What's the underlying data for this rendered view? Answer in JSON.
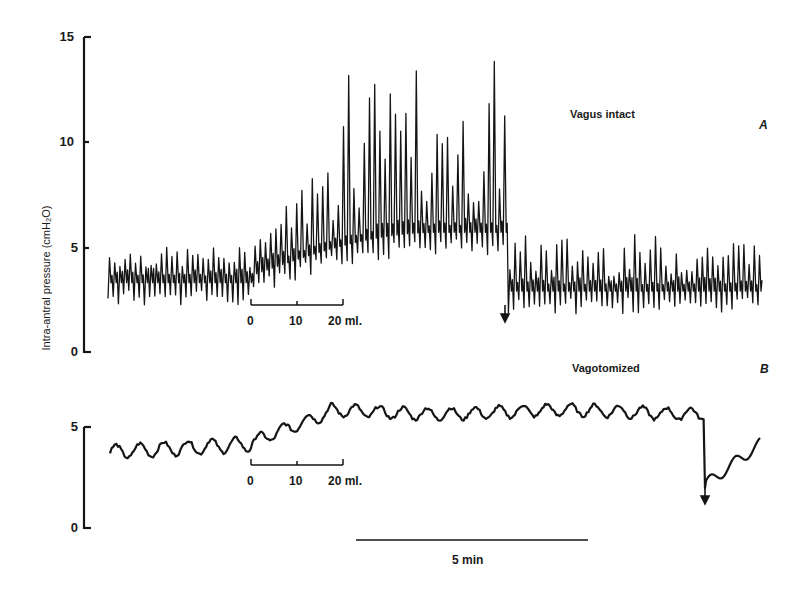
{
  "chart_data": [
    {
      "panel": "A",
      "type": "line",
      "title": "Vagus intact",
      "panel_letter": "A",
      "ylabel": "Intra-antral pressure (cmH₂O)",
      "yticks": [
        0,
        5,
        10,
        15
      ],
      "ylim": [
        0,
        15
      ],
      "grid": false,
      "description": "Phasic antral contractions; baseline ~3-4 cmH2O with oscillation peaks ~4-5; during 0-20 ml infusion baseline rises to ~6 and peaks reach ~14-15; after release (arrow) pressure drops to ~3 with peaks ~4-5.5",
      "segments": [
        {
          "phase": "baseline",
          "t_min": [
            0.0,
            3.2
          ],
          "mean": 3.6,
          "peak_amplitude": 1.4,
          "max_peak": 5.0
        },
        {
          "phase": "distension",
          "t_min": [
            3.2,
            9.0
          ],
          "mean_start": 4.0,
          "mean_end": 6.0,
          "max_peak": 15.3,
          "typical_peak": 12
        },
        {
          "phase": "after_release",
          "t_min": [
            9.0,
            14.2
          ],
          "mean": 3.2,
          "peak_amplitude": 1.6,
          "max_peak": 5.6
        }
      ],
      "infusion_scale": {
        "ticks": [
          "0",
          "10",
          "20 ml."
        ],
        "units": "ml"
      },
      "release_marker": "arrow-down"
    },
    {
      "panel": "B",
      "type": "line",
      "title": "Vagotomized",
      "panel_letter": "B",
      "yticks": [
        0,
        5
      ],
      "ylim": [
        0,
        5
      ],
      "grid": false,
      "description": "Low-amplitude slow waves; baseline ~4 rising to ~5.7-6 cmH2O during and after infusion, dropping to ~2 after release (arrow) then recovering toward ~4",
      "segments": [
        {
          "phase": "baseline",
          "t_min": [
            0.0,
            3.2
          ],
          "mean": 4.0,
          "peak_amplitude": 0.6
        },
        {
          "phase": "distension",
          "t_min": [
            3.2,
            12.5
          ],
          "mean_start": 4.5,
          "mean_end": 5.9,
          "peak_amplitude": 0.6
        },
        {
          "phase": "after_release",
          "t_min": [
            12.5,
            13.2
          ],
          "start": 2.2,
          "end": 4.2
        }
      ],
      "infusion_scale": {
        "ticks": [
          "0",
          "10",
          "20 ml."
        ],
        "units": "ml"
      },
      "release_marker": "arrow-down"
    }
  ],
  "figure": {
    "ylabel": "Intra-antral pressure (cmH₂O)",
    "panelA": {
      "title": "Vagus intact",
      "letter": "A",
      "ticks": [
        "15",
        "10",
        "5",
        "0"
      ]
    },
    "panelB": {
      "title": "Vagotomized",
      "letter": "B",
      "ticks": [
        "5",
        "0"
      ]
    },
    "infusionA": {
      "t0": "0",
      "t1": "10",
      "t2": "20 ml."
    },
    "infusionB": {
      "t0": "0",
      "t1": "10",
      "t2": "20 ml."
    },
    "timescale": {
      "label": "5 min"
    },
    "ink_color": "#151515"
  }
}
